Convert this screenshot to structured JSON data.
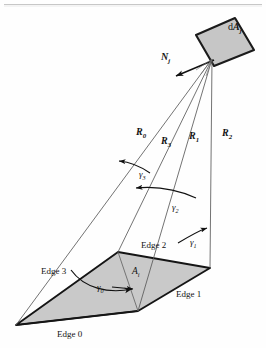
{
  "figure": {
    "name": "form-factor-geometry-diagram",
    "background_color": "#fefefe",
    "line_color": "#1a1a1a",
    "thin_line_color": "#4a4a4a",
    "patch_fill": "#c8c8c8",
    "element_fill": "#c4c4c4"
  },
  "labels": {
    "element": {
      "base": "d",
      "var": "A",
      "sub": "j"
    },
    "normal": {
      "base": "N",
      "sub": "j"
    },
    "area": {
      "base": "A",
      "sub": "i"
    },
    "rays": [
      {
        "base": "R",
        "sub": "0"
      },
      {
        "base": "R",
        "sub": "3"
      },
      {
        "base": "R",
        "sub": "1"
      },
      {
        "base": "R",
        "sub": "2"
      }
    ],
    "angles": [
      {
        "base": "γ",
        "sub": "0"
      },
      {
        "base": "γ",
        "sub": "1"
      },
      {
        "base": "γ",
        "sub": "2"
      },
      {
        "base": "γ",
        "sub": "3"
      }
    ],
    "edges": [
      "Edge 0",
      "Edge 1",
      "Edge 2",
      "Edge 3"
    ]
  }
}
